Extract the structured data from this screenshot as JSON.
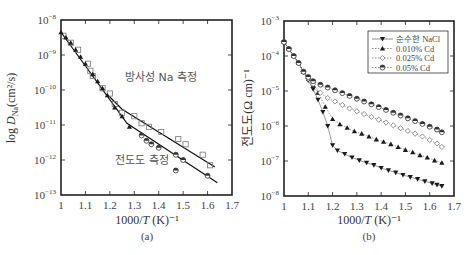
{
  "chart_data": [
    {
      "panel": "(a)",
      "type": "scatter",
      "title": "",
      "xlabel": "1000/T (K)^-1",
      "ylabel": "log D_Na (cm^2/s)",
      "xlim": [
        1.0,
        1.7
      ],
      "ylim_log10": [
        -13,
        -8
      ],
      "x_ticks": [
        "1",
        "1.1",
        "1.2",
        "1.3",
        "1.4",
        "1.5",
        "1.6",
        "1.7"
      ],
      "y_ticks": [
        "10^-8",
        "10^-9",
        "10^-10",
        "10^-11",
        "10^-12",
        "10^-13"
      ],
      "annotations": [
        "방사성 Na 측정",
        "전도도 측정"
      ],
      "caption": "(a)",
      "series": [
        {
          "name": "방사성 Na 측정 (open squares)",
          "marker": "open-square",
          "points_log10": [
            [
              1.01,
              -8.45
            ],
            [
              1.04,
              -8.65
            ],
            [
              1.07,
              -8.85
            ],
            [
              1.11,
              -9.25
            ],
            [
              1.12,
              -9.45
            ],
            [
              1.13,
              -9.6
            ],
            [
              1.17,
              -9.95
            ],
            [
              1.2,
              -10.1
            ],
            [
              1.22,
              -10.4
            ],
            [
              1.25,
              -10.65
            ],
            [
              1.3,
              -10.75
            ],
            [
              1.33,
              -10.95
            ],
            [
              1.36,
              -11.05
            ],
            [
              1.41,
              -11.2
            ],
            [
              1.48,
              -11.4
            ],
            [
              1.51,
              -11.55
            ],
            [
              1.58,
              -11.85
            ],
            [
              1.61,
              -12.15
            ]
          ]
        },
        {
          "name": "전도도 측정 (filled triangles / half-filled circles)",
          "marker": "filled-triangle",
          "points_log10": [
            [
              1.0,
              -8.35
            ],
            [
              1.02,
              -8.5
            ],
            [
              1.04,
              -8.65
            ],
            [
              1.06,
              -8.85
            ],
            [
              1.08,
              -9.05
            ],
            [
              1.1,
              -9.25
            ],
            [
              1.13,
              -9.55
            ],
            [
              1.15,
              -9.75
            ],
            [
              1.17,
              -9.95
            ],
            [
              1.19,
              -10.15
            ],
            [
              1.22,
              -10.5
            ],
            [
              1.25,
              -10.75
            ],
            [
              1.28,
              -11.05
            ],
            [
              1.33,
              -11.3
            ],
            [
              1.35,
              -11.45
            ],
            [
              1.37,
              -11.55
            ],
            [
              1.4,
              -11.65
            ],
            [
              1.47,
              -11.85
            ],
            [
              1.5,
              -12.0
            ],
            [
              1.47,
              -12.3
            ],
            [
              1.6,
              -12.45
            ]
          ]
        }
      ],
      "fit_lines_log10": [
        {
          "name": "upper fit",
          "from": [
            1.25,
            -10.55
          ],
          "to": [
            1.63,
            -12.2
          ]
        },
        {
          "name": "lower fit",
          "from": [
            1.0,
            -8.35
          ],
          "to": [
            1.64,
            -12.65
          ],
          "knee": [
            1.27,
            -10.95
          ]
        }
      ]
    },
    {
      "panel": "(b)",
      "type": "line",
      "title": "",
      "xlabel": "1000/T (K)^-1",
      "ylabel": "전도도(Ω cm)^-1",
      "xlim": [
        1.0,
        1.7
      ],
      "ylim_log10": [
        -8,
        -3
      ],
      "x_ticks": [
        "1",
        "1.1",
        "1.2",
        "1.3",
        "1.4",
        "1.5",
        "1.6",
        "1.7"
      ],
      "y_ticks": [
        "10^-3",
        "10^-4",
        "10^-5",
        "10^-6",
        "10^-7",
        "10^-8"
      ],
      "legend_position": "upper right",
      "caption": "(b)",
      "series": [
        {
          "name": "순수한 NaCl",
          "marker": "filled-down-triangle",
          "x": [
            1.0,
            1.02,
            1.04,
            1.06,
            1.08,
            1.1,
            1.12,
            1.14,
            1.16,
            1.18,
            1.2,
            1.22,
            1.25,
            1.28,
            1.31,
            1.34,
            1.37,
            1.4,
            1.43,
            1.46,
            1.49,
            1.52,
            1.55,
            1.58,
            1.61,
            1.63,
            1.65
          ],
          "log10_y": [
            -3.6,
            -3.8,
            -4.0,
            -4.2,
            -4.45,
            -4.7,
            -4.95,
            -5.25,
            -5.6,
            -6.0,
            -6.55,
            -6.7,
            -6.8,
            -6.9,
            -6.98,
            -7.05,
            -7.12,
            -7.2,
            -7.27,
            -7.33,
            -7.4,
            -7.46,
            -7.52,
            -7.58,
            -7.64,
            -7.68,
            -7.72
          ]
        },
        {
          "name": "0.010% Cd",
          "marker": "filled-up-triangle",
          "x": [
            1.0,
            1.02,
            1.04,
            1.06,
            1.08,
            1.1,
            1.12,
            1.14,
            1.17,
            1.2,
            1.23,
            1.26,
            1.29,
            1.32,
            1.35,
            1.38,
            1.41,
            1.44,
            1.47,
            1.5,
            1.53,
            1.56,
            1.59,
            1.62,
            1.65
          ],
          "log10_y": [
            -3.6,
            -3.8,
            -4.0,
            -4.2,
            -4.45,
            -4.65,
            -4.85,
            -5.05,
            -5.45,
            -5.8,
            -5.95,
            -6.05,
            -6.15,
            -6.22,
            -6.3,
            -6.38,
            -6.45,
            -6.52,
            -6.6,
            -6.68,
            -6.75,
            -6.83,
            -6.9,
            -6.98,
            -7.05
          ]
        },
        {
          "name": "0.025% Cd",
          "marker": "open-diamond",
          "x": [
            1.0,
            1.02,
            1.04,
            1.06,
            1.08,
            1.1,
            1.12,
            1.15,
            1.18,
            1.21,
            1.24,
            1.27,
            1.3,
            1.33,
            1.36,
            1.39,
            1.42,
            1.45,
            1.48,
            1.51,
            1.54,
            1.57,
            1.6,
            1.63,
            1.65
          ],
          "log10_y": [
            -3.6,
            -3.8,
            -4.0,
            -4.2,
            -4.45,
            -4.65,
            -4.8,
            -5.05,
            -5.2,
            -5.3,
            -5.4,
            -5.5,
            -5.58,
            -5.66,
            -5.74,
            -5.82,
            -5.9,
            -5.98,
            -6.06,
            -6.14,
            -6.22,
            -6.3,
            -6.4,
            -6.5,
            -6.6
          ]
        },
        {
          "name": "0.05% Cd",
          "marker": "half-filled-circle",
          "x": [
            1.0,
            1.02,
            1.04,
            1.06,
            1.08,
            1.1,
            1.12,
            1.15,
            1.18,
            1.21,
            1.24,
            1.27,
            1.3,
            1.33,
            1.36,
            1.39,
            1.42,
            1.45,
            1.48,
            1.51,
            1.54,
            1.57,
            1.6,
            1.63,
            1.65
          ],
          "log10_y": [
            -3.6,
            -3.8,
            -4.0,
            -4.2,
            -4.45,
            -4.6,
            -4.72,
            -4.82,
            -4.9,
            -4.98,
            -5.06,
            -5.14,
            -5.22,
            -5.3,
            -5.38,
            -5.46,
            -5.54,
            -5.62,
            -5.7,
            -5.78,
            -5.86,
            -5.94,
            -6.02,
            -6.1,
            -6.18
          ]
        }
      ]
    }
  ],
  "labels": {
    "a": {
      "ylabel_prefix": "log ",
      "ylabel_D": "D",
      "ylabel_sub": "Na",
      "ylabel_unit": "(cm²/s)",
      "xlabel": "1000/",
      "xlabel_T": "T",
      "xlabel_unit": " (K)⁻¹",
      "annot_radio": "방사성 Na 측정",
      "annot_cond": "전도도 측정",
      "caption": "(a)"
    },
    "b": {
      "ylabel": "전도도(Ω cm)⁻¹",
      "xlabel": "1000/",
      "xlabel_T": "T",
      "xlabel_unit": " (K)⁻¹",
      "caption": "(b)",
      "legend": [
        "순수한 NaCl",
        "0.010% Cd",
        "0.025% Cd",
        "0.05% Cd"
      ]
    }
  },
  "colors": {
    "axis": "#222222",
    "marker": "#1a1a1a",
    "text": "#444444",
    "open_marker": "#777777"
  }
}
